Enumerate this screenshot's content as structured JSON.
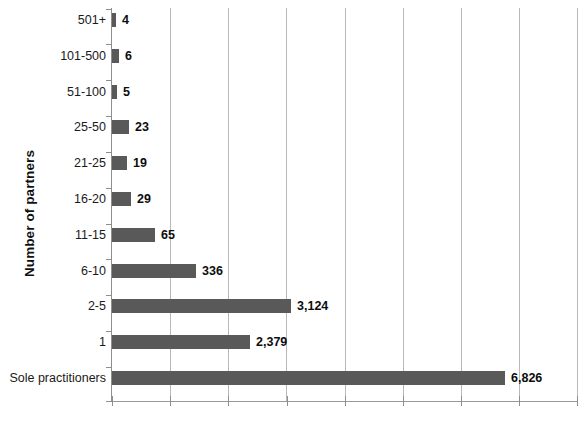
{
  "chart_data": {
    "type": "bar",
    "orientation": "horizontal",
    "title": "",
    "xlabel": "",
    "ylabel": "Number of partners",
    "categories": [
      "501+",
      "101-500",
      "51-100",
      "25-50",
      "21-25",
      "16-20",
      "11-15",
      "6-10",
      "2-5",
      "1",
      "Sole practitioners"
    ],
    "values": [
      4,
      6,
      5,
      23,
      19,
      29,
      65,
      336,
      3124,
      2379,
      6826
    ],
    "value_labels": [
      "4",
      "6",
      "5",
      "23",
      "19",
      "29",
      "65",
      "336",
      "3,124",
      "2,379",
      "6,826"
    ],
    "bar_pixel_widths": [
      4,
      7,
      5,
      17,
      15,
      19,
      43,
      84,
      179,
      138,
      393
    ],
    "xlim": [
      0,
      8000
    ],
    "x_tick_count": 9,
    "x_tick_labels": [],
    "grid": true,
    "grid_axis": "x",
    "legend": false,
    "bar_color": "#595959",
    "grid_color": "#b9b9b9",
    "axis_color": "#8e8e8e",
    "background": "#ffffff"
  },
  "axis": {
    "y_title": "Number of partners"
  }
}
